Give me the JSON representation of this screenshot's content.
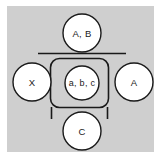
{
  "diagram": {
    "type": "uml-state-diagram",
    "panel_color": "#cfcfcf",
    "node_fill": "#ffffff",
    "stroke_color": "#1a1a1a",
    "nodes": [
      {
        "id": "top",
        "label": "A, B",
        "shape": "circle"
      },
      {
        "id": "left",
        "label": "X",
        "shape": "circle"
      },
      {
        "id": "center",
        "label": "a, b, c",
        "shape": "circle"
      },
      {
        "id": "right",
        "label": "A",
        "shape": "circle"
      },
      {
        "id": "bottom",
        "label": "C",
        "shape": "circle"
      }
    ],
    "container": {
      "shape": "rounded-rectangle",
      "encloses": "center"
    },
    "separator": {
      "shape": "horizontal-line"
    },
    "stems": {
      "shape": "vertical-lines",
      "count": 2
    }
  }
}
